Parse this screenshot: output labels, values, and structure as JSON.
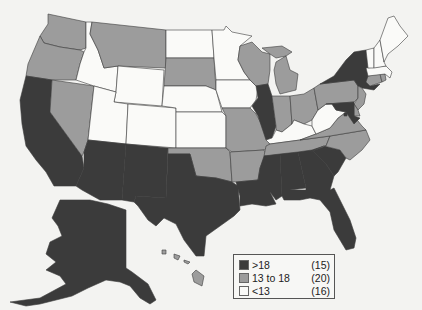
{
  "colors": {
    "high": "#3b3b3b",
    "mid": "#9c9c9c",
    "low": "#fafaf8",
    "background": "#f3f3f1",
    "border": "#3c3c3c"
  },
  "legend": {
    "items": [
      {
        "key": "high",
        "label": ">18",
        "count": "(15)"
      },
      {
        "key": "mid",
        "label": "13 to 18",
        "count": "(20)"
      },
      {
        "key": "low",
        "label": "<13",
        "count": "(16)"
      }
    ]
  },
  "states": {
    "WA": "mid",
    "OR": "mid",
    "CA": "high",
    "NV": "mid",
    "ID": "low",
    "MT": "mid",
    "WY": "low",
    "UT": "low",
    "AZ": "high",
    "CO": "low",
    "NM": "high",
    "ND": "low",
    "SD": "mid",
    "NE": "low",
    "KS": "low",
    "OK": "mid",
    "TX": "high",
    "MN": "low",
    "IA": "low",
    "MO": "mid",
    "AR": "mid",
    "LA": "high",
    "WI": "mid",
    "IL": "high",
    "MI": "mid",
    "IN": "mid",
    "OH": "mid",
    "KY": "low",
    "TN": "mid",
    "MS": "high",
    "AL": "high",
    "GA": "high",
    "FL": "high",
    "SC": "high",
    "NC": "mid",
    "VA": "mid",
    "WV": "low",
    "PA": "mid",
    "NY": "high",
    "NJ": "mid",
    "DE": "mid",
    "MD": "high",
    "DC": "high",
    "CT": "mid",
    "RI": "mid",
    "MA": "low",
    "VT": "low",
    "NH": "low",
    "ME": "low",
    "AK": "high",
    "HI": "mid"
  }
}
